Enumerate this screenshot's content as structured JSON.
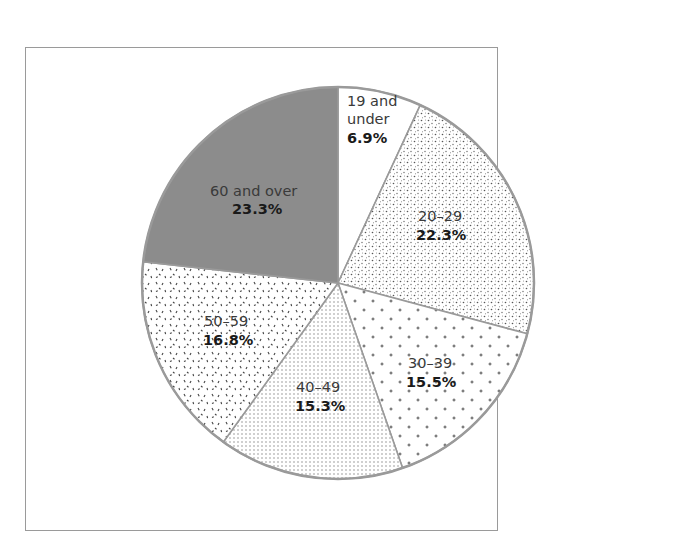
{
  "header": {
    "caption_cut_text": ""
  },
  "chart_data": {
    "type": "pie",
    "title": "",
    "start_angle": "12 o'clock",
    "direction": "clockwise",
    "legend": "none (inline slice labels)",
    "categories": [
      "19 and under",
      "20–29",
      "30–39",
      "40–49",
      "50–59",
      "60 and over"
    ],
    "values": [
      6.9,
      22.3,
      15.5,
      15.3,
      16.8,
      23.3
    ],
    "unit": "%",
    "slices": [
      {
        "label": "19 and under",
        "label_lines": [
          "19 and",
          "under"
        ],
        "value": 6.9,
        "value_text": "6.9%",
        "fill": "white"
      },
      {
        "label": "20–29",
        "label_lines": [
          "20–29"
        ],
        "value": 22.3,
        "value_text": "22.3%",
        "fill": "dense-stipple"
      },
      {
        "label": "30–39",
        "label_lines": [
          "30–39"
        ],
        "value": 15.5,
        "value_text": "15.5%",
        "fill": "plus-pattern"
      },
      {
        "label": "40–49",
        "label_lines": [
          "40–49"
        ],
        "value": 15.3,
        "value_text": "15.3%",
        "fill": "fine-dot-grid"
      },
      {
        "label": "50–59",
        "label_lines": [
          "50–59"
        ],
        "value": 16.8,
        "value_text": "16.8%",
        "fill": "dash-speckle"
      },
      {
        "label": "60 and over",
        "label_lines": [
          "60 and over"
        ],
        "value": 23.3,
        "value_text": "23.3%",
        "fill": "solid-gray"
      }
    ]
  },
  "colors": {
    "outline": "#9a9a9a",
    "gray_slice": "#8c8c8c",
    "frame": "#9a9a9a",
    "text": "#333333"
  }
}
